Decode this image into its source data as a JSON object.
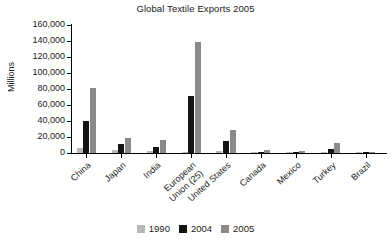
{
  "chart_data": {
    "type": "bar",
    "title": "Global Textile Exports 2005",
    "xlabel": "",
    "ylabel": "Millions",
    "ylim": [
      0,
      160000
    ],
    "ytick_step": 20000,
    "ytick_labels": [
      "160,000",
      "140,000",
      "120,000",
      "100,000",
      "80,000",
      "60,000",
      "40,000",
      "20,000",
      "0"
    ],
    "ytick_values": [
      160000,
      140000,
      120000,
      100000,
      80000,
      60000,
      40000,
      20000,
      0
    ],
    "grid": false,
    "legend_position": "bottom-center",
    "categories": [
      "China",
      "Japan",
      "India",
      "European Union (25)",
      "United States",
      "Canada",
      "Mexico",
      "Turkey",
      "Brazil"
    ],
    "series": [
      {
        "name": "1990",
        "color": "#b8b8b8",
        "values": [
          6000,
          4000,
          2000,
          1500,
          3000,
          700,
          300,
          1500,
          400
        ]
      },
      {
        "name": "2004",
        "color": "#141414",
        "values": [
          39500,
          11500,
          8000,
          71000,
          15000,
          1500,
          1200,
          5500,
          500
        ]
      },
      {
        "name": "2005",
        "color": "#8a8a8a",
        "values": [
          81000,
          19000,
          16500,
          139000,
          28500,
          3500,
          3000,
          13000,
          1000
        ]
      }
    ]
  },
  "legend": {
    "items": [
      {
        "label": "1990",
        "color": "#b8b8b8"
      },
      {
        "label": "2004",
        "color": "#141414"
      },
      {
        "label": "2005",
        "color": "#8a8a8a"
      }
    ]
  }
}
